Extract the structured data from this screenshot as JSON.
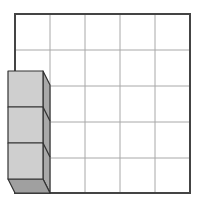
{
  "diagram": {
    "grid": {
      "rows": 5,
      "cols": 5,
      "line_color": "#a8a8a8",
      "border_color": "#444444"
    },
    "cube_stack": {
      "count": 3,
      "front_color": "#cfcfcf",
      "side_color": "#a9a9a9",
      "bottom_color": "#a0a0a0",
      "edge_color": "#333333"
    }
  }
}
